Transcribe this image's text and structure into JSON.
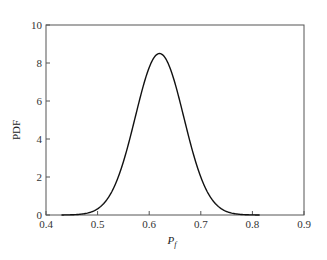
{
  "chart_data": {
    "type": "line",
    "title": "",
    "xlabel": "P_f",
    "ylabel": "PDF",
    "xlim": [
      0.4,
      0.9
    ],
    "ylim": [
      0,
      10
    ],
    "xticks": [
      0.4,
      0.5,
      0.6,
      0.7,
      0.8,
      0.9
    ],
    "xtick_labels": [
      "0.4",
      "0.5",
      "0.6",
      "0.7",
      "0.8",
      "0.9"
    ],
    "yticks": [
      0,
      2,
      4,
      6,
      8,
      10
    ],
    "ytick_labels": [
      "0",
      "2",
      "4",
      "6",
      "8",
      "10"
    ],
    "grid": false,
    "legend": null,
    "series": [
      {
        "name": "PDF of P_f",
        "distribution": "normal-like",
        "mean": 0.62,
        "std": 0.047,
        "peak": 8.5,
        "x_range": [
          0.43,
          0.815
        ],
        "x": [
          0.43,
          0.45,
          0.47,
          0.49,
          0.51,
          0.53,
          0.55,
          0.57,
          0.59,
          0.61,
          0.62,
          0.63,
          0.65,
          0.67,
          0.69,
          0.71,
          0.73,
          0.75,
          0.77,
          0.79,
          0.815
        ],
        "values": [
          0.02,
          0.08,
          0.25,
          0.62,
          1.3,
          2.4,
          3.9,
          5.6,
          7.3,
          8.4,
          8.5,
          8.4,
          7.3,
          5.6,
          3.9,
          2.4,
          1.3,
          0.62,
          0.25,
          0.08,
          0.02
        ]
      }
    ]
  }
}
